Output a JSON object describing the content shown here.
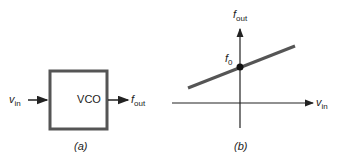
{
  "panel_a": {
    "block_label": "VCO",
    "input_label": "v",
    "input_sub": "in",
    "output_label": "f",
    "output_sub": "out",
    "caption": "(a)"
  },
  "panel_b": {
    "y_axis_label": "f",
    "y_axis_sub": "out",
    "x_axis_label": "v",
    "x_axis_sub": "in",
    "intercept_label": "f",
    "intercept_sub": "0",
    "caption": "(b)"
  },
  "colors": {
    "box_stroke": "#555555",
    "line": "#555555",
    "axis": "#222222"
  }
}
